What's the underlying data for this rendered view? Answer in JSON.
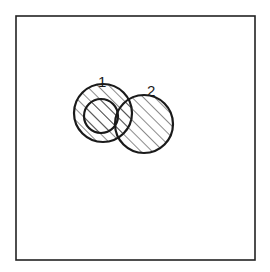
{
  "diagram": {
    "frame": {
      "x": 16,
      "y": 16,
      "width": 239,
      "height": 244,
      "stroke": "#222222"
    },
    "hatch": {
      "spacing": 8,
      "angle": -45,
      "color": "#2a2a2a"
    },
    "circles": [
      {
        "id": "1",
        "label": "1",
        "cx": 103,
        "cy": 113,
        "r": 29,
        "label_x": 98,
        "label_y": 87
      },
      {
        "id": "inner",
        "label": "",
        "cx": 101,
        "cy": 116,
        "r": 17
      },
      {
        "id": "2",
        "label": "2",
        "cx": 144,
        "cy": 124,
        "r": 29,
        "label_x": 147,
        "label_y": 96
      }
    ],
    "line_color": "#1a1a1a"
  }
}
